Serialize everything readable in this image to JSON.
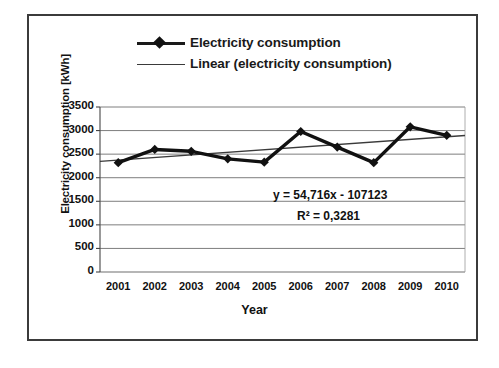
{
  "chart_data": {
    "type": "line",
    "title": "",
    "xlabel": "Year",
    "ylabel": "Electricity consumption [kWh]",
    "categories": [
      "2001",
      "2002",
      "2003",
      "2004",
      "2005",
      "2006",
      "2007",
      "2008",
      "2009",
      "2010"
    ],
    "x": [
      2001,
      2002,
      2003,
      2004,
      2005,
      2006,
      2007,
      2008,
      2009,
      2010
    ],
    "series": [
      {
        "name": "Electricity consumption",
        "type": "line",
        "marker": "diamond",
        "color": "#111111",
        "values": [
          2320,
          2600,
          2560,
          2400,
          2330,
          2980,
          2650,
          2320,
          3080,
          2900
        ]
      },
      {
        "name": "Linear (electricity consumption)",
        "type": "trendline",
        "color": "#3a3a3a",
        "values": [
          2375,
          2430,
          2484,
          2539,
          2594,
          2649,
          2703,
          2758,
          2813,
          2868
        ]
      }
    ],
    "ylim": [
      0,
      3500
    ],
    "yticks": [
      0,
      500,
      1000,
      1500,
      2000,
      2500,
      3000,
      3500
    ],
    "ytick_labels": [
      "0",
      "500",
      "1000",
      "1500",
      "2000",
      "2500",
      "3000",
      "3500"
    ],
    "grid": true,
    "grid_axis": "y",
    "legend_position": "top",
    "annotations": [
      {
        "id": "trend-equation",
        "text": "y = 54,716x - 107123"
      },
      {
        "id": "r-squared",
        "text_prefix": "R",
        "text_sup": "2",
        "text_suffix": " = 0,3281",
        "full": "R² = 0,3281"
      }
    ]
  },
  "legend": {
    "items": [
      {
        "label": "Electricity consumption",
        "key": "line-marker-key"
      },
      {
        "label": "Linear (electricity consumption)",
        "key": "line-key"
      }
    ]
  },
  "axes": {
    "y_title": "Electricity consumption [kWh]",
    "x_title": "Year"
  }
}
